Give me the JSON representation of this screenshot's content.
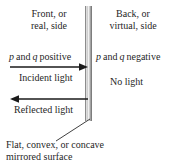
{
  "figure": {
    "type": "optics-sign-convention-diagram"
  },
  "labels": {
    "front_side_line1": "Front, or",
    "front_side_line2": "real, side",
    "back_side_line1": "Back, or",
    "back_side_line2": "virtual, side",
    "positive_var1": "p",
    "positive_and": "and",
    "positive_var2": "q",
    "positive_sign": "positive",
    "negative_var1": "p",
    "negative_and": "and",
    "negative_var2": "q",
    "negative_sign": "negative",
    "incident_light": "Incident light",
    "reflected_light": "Reflected light",
    "no_light": "No light",
    "caption_line1": "Flat, convex, or concave",
    "caption_line2": "mirrored surface"
  },
  "elements": {
    "mirror_name": "mirrored surface strip",
    "incident_arrow_direction": "right",
    "reflected_arrow_direction": "left",
    "leader_line": "pointer from mirror surface to caption"
  },
  "colors": {
    "background": "#ffffff",
    "text": "#1f1f1f",
    "line": "#1a1a1a",
    "mirror_light": "#f4f4f4",
    "mirror_dark": "#8e8e8e"
  }
}
